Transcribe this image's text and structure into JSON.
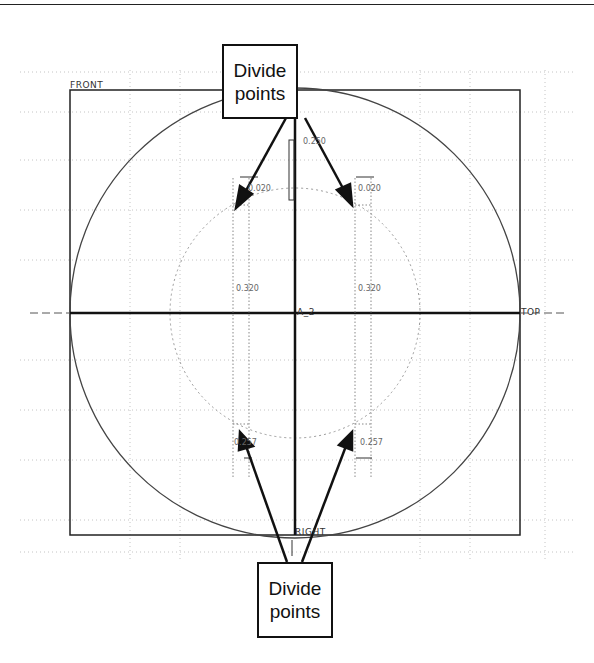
{
  "callouts": {
    "top": {
      "line1": "Divide",
      "line2": "points"
    },
    "bottom": {
      "line1": "Divide",
      "line2": "points"
    }
  },
  "datum_planes": {
    "front": "FRONT",
    "top": "TOP",
    "right": "RIGHT"
  },
  "axis_label": "A_2",
  "dimensions": {
    "center_height": "0.250",
    "upper_left": "0.020",
    "upper_right": "0.020",
    "mid_left": "0.320",
    "mid_right": "0.320",
    "lower_left": "0.257",
    "lower_right": "0.257"
  },
  "colors": {
    "line": "#111111",
    "construction": "#888888",
    "grid_dots": "#bbbbbb"
  }
}
